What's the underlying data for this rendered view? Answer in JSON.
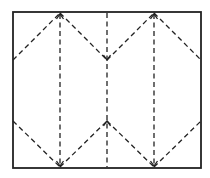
{
  "diagram": {
    "type": "fold-pattern",
    "canvas": {
      "width": 210,
      "height": 178,
      "background": "#ffffff"
    },
    "stroke_color": "#222222",
    "frame": {
      "x1": 13,
      "y1": 12,
      "x2": 201,
      "y2": 168,
      "stroke_width": 1.8
    },
    "dash_pattern": "5,3.5",
    "dashed_stroke_width": 1.3,
    "vertical_lines": [
      {
        "id": "left-vertical",
        "x": 60,
        "y1": 14,
        "y2": 166
      },
      {
        "id": "center-vertical",
        "x": 107,
        "y1": 13,
        "y2": 167
      },
      {
        "id": "right-vertical",
        "x": 154,
        "y1": 14,
        "y2": 166
      }
    ],
    "diagonal_lines": [
      {
        "id": "upper-left-outer",
        "x1": 13,
        "y1": 60,
        "x2": 60,
        "y2": 13
      },
      {
        "id": "upper-left-inner",
        "x1": 60,
        "y1": 13,
        "x2": 107,
        "y2": 60
      },
      {
        "id": "upper-right-inner",
        "x1": 107,
        "y1": 60,
        "x2": 154,
        "y2": 13
      },
      {
        "id": "upper-right-outer",
        "x1": 154,
        "y1": 13,
        "x2": 201,
        "y2": 60
      },
      {
        "id": "lower-left-outer",
        "x1": 13,
        "y1": 121,
        "x2": 60,
        "y2": 167
      },
      {
        "id": "lower-left-inner",
        "x1": 60,
        "y1": 167,
        "x2": 107,
        "y2": 121
      },
      {
        "id": "lower-right-inner",
        "x1": 107,
        "y1": 121,
        "x2": 154,
        "y2": 167
      },
      {
        "id": "lower-right-outer",
        "x1": 154,
        "y1": 167,
        "x2": 201,
        "y2": 121
      }
    ],
    "arrows": [
      {
        "id": "arrow-top-left",
        "x": 60,
        "y": 14,
        "direction": "up"
      },
      {
        "id": "arrow-top-right",
        "x": 154,
        "y": 14,
        "direction": "up"
      },
      {
        "id": "arrow-center-upper",
        "x": 107,
        "y": 60,
        "direction": "down"
      },
      {
        "id": "arrow-center-lower",
        "x": 107,
        "y": 121,
        "direction": "up"
      },
      {
        "id": "arrow-bottom-left",
        "x": 60,
        "y": 166,
        "direction": "down"
      },
      {
        "id": "arrow-bottom-right",
        "x": 154,
        "y": 166,
        "direction": "down"
      }
    ]
  }
}
